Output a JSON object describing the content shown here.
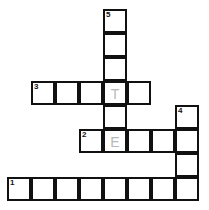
{
  "puzzle": {
    "cell_size": 24,
    "cells": [
      {
        "x": 104,
        "y": 10,
        "num": "5",
        "letter": ""
      },
      {
        "x": 104,
        "y": 34,
        "num": "",
        "letter": ""
      },
      {
        "x": 104,
        "y": 58,
        "num": "",
        "letter": ""
      },
      {
        "x": 32,
        "y": 82,
        "num": "3",
        "letter": ""
      },
      {
        "x": 56,
        "y": 82,
        "num": "",
        "letter": ""
      },
      {
        "x": 80,
        "y": 82,
        "num": "",
        "letter": ""
      },
      {
        "x": 104,
        "y": 82,
        "num": "",
        "letter": "T"
      },
      {
        "x": 128,
        "y": 82,
        "num": "",
        "letter": ""
      },
      {
        "x": 104,
        "y": 106,
        "num": "",
        "letter": ""
      },
      {
        "x": 176,
        "y": 106,
        "num": "4",
        "letter": ""
      },
      {
        "x": 80,
        "y": 130,
        "num": "2",
        "letter": ""
      },
      {
        "x": 104,
        "y": 130,
        "num": "",
        "letter": "E"
      },
      {
        "x": 128,
        "y": 130,
        "num": "",
        "letter": ""
      },
      {
        "x": 152,
        "y": 130,
        "num": "",
        "letter": ""
      },
      {
        "x": 176,
        "y": 130,
        "num": "",
        "letter": ""
      },
      {
        "x": 176,
        "y": 154,
        "num": "",
        "letter": ""
      },
      {
        "x": 8,
        "y": 178,
        "num": "1",
        "letter": ""
      },
      {
        "x": 32,
        "y": 178,
        "num": "",
        "letter": ""
      },
      {
        "x": 56,
        "y": 178,
        "num": "",
        "letter": ""
      },
      {
        "x": 80,
        "y": 178,
        "num": "",
        "letter": ""
      },
      {
        "x": 104,
        "y": 178,
        "num": "",
        "letter": ""
      },
      {
        "x": 128,
        "y": 178,
        "num": "",
        "letter": ""
      },
      {
        "x": 152,
        "y": 178,
        "num": "",
        "letter": ""
      },
      {
        "x": 176,
        "y": 178,
        "num": "",
        "letter": ""
      }
    ],
    "entries": [
      {
        "number": "1",
        "direction": "across",
        "length": 8
      },
      {
        "number": "2",
        "direction": "across",
        "length": 5
      },
      {
        "number": "3",
        "direction": "across",
        "length": 5
      },
      {
        "number": "4",
        "direction": "down",
        "length": 4
      },
      {
        "number": "5",
        "direction": "down",
        "length": 6
      }
    ],
    "colors": {
      "border": "#111111",
      "pencil": "#b8b8b8",
      "background": "#ffffff"
    }
  }
}
